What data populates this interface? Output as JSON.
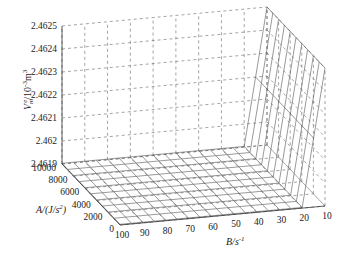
{
  "chart_data": {
    "type": "surface3d",
    "title": "",
    "zlabel": "V_m^e / 10^-3 m^3",
    "xlabel": "B/s^-1",
    "ylabel": "A/(J/s^2)",
    "z_ticks": [
      "2.4625",
      "2.4624",
      "2.4623",
      "2.4622",
      "2.4621",
      "2.462",
      "2.4619"
    ],
    "a_ticks": [
      "10000",
      "8000",
      "6000",
      "4000",
      "2000",
      "0"
    ],
    "b_ticks": [
      "100",
      "90",
      "80",
      "70",
      "60",
      "50",
      "40",
      "30",
      "20",
      "10"
    ],
    "zlim": [
      2.4619,
      2.4625
    ],
    "alim": [
      0,
      10000
    ],
    "blim": [
      10,
      100
    ],
    "grid": true,
    "surface_samples": [
      {
        "B": 100,
        "z": 2.4619
      },
      {
        "B": 90,
        "z": 2.4619
      },
      {
        "B": 80,
        "z": 2.4619
      },
      {
        "B": 70,
        "z": 2.4619
      },
      {
        "B": 60,
        "z": 2.4619
      },
      {
        "B": 50,
        "z": 2.4619
      },
      {
        "B": 40,
        "z": 2.4619
      },
      {
        "B": 30,
        "z": 2.4619
      },
      {
        "B": 20,
        "z": 2.4619
      },
      {
        "B": 10,
        "z": 2.4625
      }
    ]
  },
  "labels": {
    "z_axis_title_main": "V",
    "z_axis_title_sub": "m",
    "z_axis_title_sup": "e",
    "z_axis_title_rest": "/10",
    "z_axis_title_exp": "-3",
    "z_axis_title_unit": "m",
    "z_axis_title_unit_exp": "3",
    "a_axis_title": "A/(J/s",
    "a_axis_title_exp": "2",
    "a_axis_title_end": ")",
    "b_axis_title": "B/s",
    "b_axis_title_exp": "-1"
  }
}
